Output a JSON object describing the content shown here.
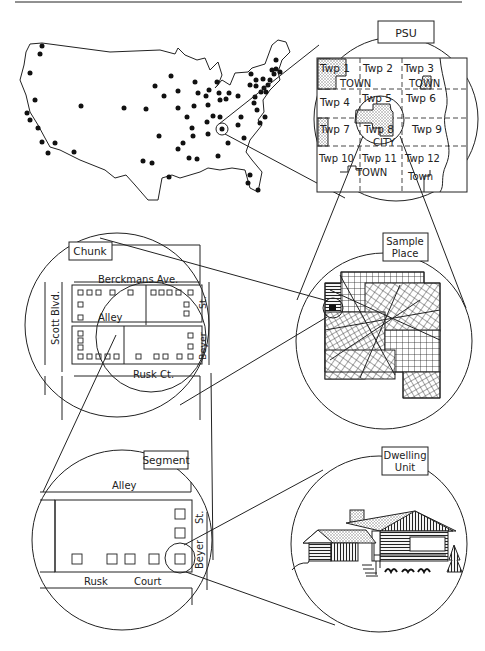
{
  "figure": {
    "stages": [
      {
        "id": "psu",
        "label": "PSU"
      },
      {
        "id": "sample_place",
        "label_line1": "Sample",
        "label_line2": "Place"
      },
      {
        "id": "chunk",
        "label": "Chunk"
      },
      {
        "id": "segment",
        "label": "Segment"
      },
      {
        "id": "dwelling_unit",
        "label_line1": "Dwelling",
        "label_line2": "Unit"
      }
    ]
  },
  "psu": {
    "label": "PSU",
    "townships": [
      "Twp 1",
      "Twp 2",
      "Twp 3",
      "Twp 4",
      "Twp 5",
      "Twp 6",
      "Twp 7",
      "Twp 8",
      "Twp 9",
      "Twp 10",
      "Twp 11",
      "Twp 12"
    ],
    "place_labels": {
      "town1": "TOWN",
      "town3": "TOWN",
      "city": "CITY",
      "town11": "TOWN",
      "town12": "Town"
    }
  },
  "chunk": {
    "label": "Chunk",
    "streets": {
      "top": "Berckmans Ave.",
      "left": "Scott Blvd.",
      "alley": "Alley",
      "right": "Beyer",
      "right_suffix": "St.",
      "bottom": "Rusk Ct."
    }
  },
  "segment": {
    "label": "Segment",
    "streets": {
      "top": "Alley",
      "right": "Beyer",
      "right_suffix": "St.",
      "bottom_left": "Rusk",
      "bottom_right": "Court"
    }
  },
  "sample_place": {
    "label_line1": "Sample",
    "label_line2": "Place"
  },
  "dwelling_unit": {
    "label_line1": "Dwelling",
    "label_line2": "Unit"
  }
}
